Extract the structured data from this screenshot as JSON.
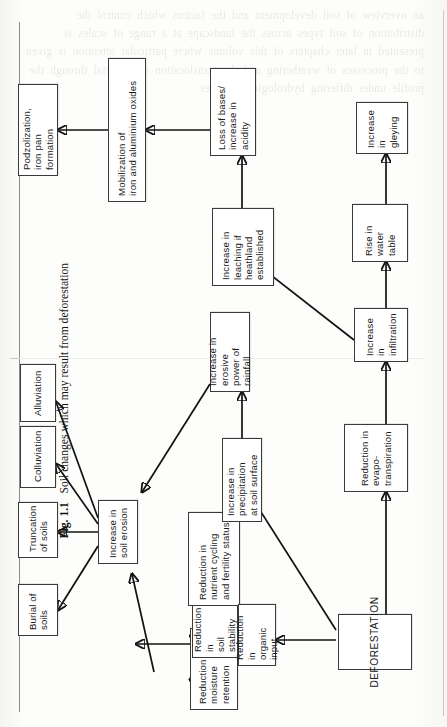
{
  "figure": {
    "caption_label": "Fig. 1.1",
    "caption_text": "Soil changes which may result from deforestation",
    "orientation": "rotated-90-ccw",
    "background_bleed_text": "an overview of soil development and the factors which control the distribution of soil types across the landscape at a range of scales is presented in later chapters of this volume where particular attention is given to the processes of weathering and the translocation of material through the profile under differing hydrological regimes",
    "colors": {
      "paper": "#fcfcfa",
      "ink": "#121212",
      "box_border": "#3a3a3a",
      "box_fill": "#ffffff",
      "rule": "#8d8d8d"
    }
  },
  "nodes": [
    {
      "id": "deforestation",
      "label": "DEFORESTATION"
    },
    {
      "id": "organic_input",
      "label": "Reduction in\norganic input"
    },
    {
      "id": "moisture",
      "label": "Reduction in\nmoisture retention"
    },
    {
      "id": "stability",
      "label": "Reduction in\nsoil stability"
    },
    {
      "id": "nutrient",
      "label": "Reduction in\nnutrient cycling\nand fertility status"
    },
    {
      "id": "precipitation",
      "label": "Increase in precipitation\nat soil surface"
    },
    {
      "id": "erosive",
      "label": "Increase in erosive\npower of rainfall"
    },
    {
      "id": "erosion",
      "label": "Increase in\nsoil erosion"
    },
    {
      "id": "burial",
      "label": "Burial of\nsoils"
    },
    {
      "id": "truncation",
      "label": "Truncation\nof soils"
    },
    {
      "id": "colluviation",
      "label": "Colluviation"
    },
    {
      "id": "alluviation",
      "label": "Alluviation"
    },
    {
      "id": "evapo",
      "label": "Reduction in\nevapo-transpiration"
    },
    {
      "id": "infiltration",
      "label": "Increase in\ninfiltration"
    },
    {
      "id": "watertable",
      "label": "Rise in\nwater table"
    },
    {
      "id": "gleying",
      "label": "Increase in\ngleying"
    },
    {
      "id": "leaching",
      "label": "Increase in\nleaching if\nheathland established"
    },
    {
      "id": "bases",
      "label": "Loss of bases/\nincrease in acidity"
    },
    {
      "id": "mobilization",
      "label": "Mobilization of\niron and aluminium oxides"
    },
    {
      "id": "podzolization",
      "label": "Podzolization,\niron pan formation"
    }
  ],
  "edges": [
    {
      "from": "deforestation",
      "to": "organic_input"
    },
    {
      "from": "deforestation",
      "to": "precipitation"
    },
    {
      "from": "deforestation",
      "to": "evapo"
    },
    {
      "from": "organic_input",
      "to": "moisture"
    },
    {
      "from": "organic_input",
      "to": "stability"
    },
    {
      "from": "organic_input",
      "to": "nutrient"
    },
    {
      "from": "organic_input",
      "to": "erosion"
    },
    {
      "from": "precipitation",
      "to": "erosive"
    },
    {
      "from": "erosive",
      "to": "erosion"
    },
    {
      "from": "moisture",
      "to": "erosion"
    },
    {
      "from": "erosion",
      "to": "burial"
    },
    {
      "from": "erosion",
      "to": "truncation"
    },
    {
      "from": "erosion",
      "to": "colluviation"
    },
    {
      "from": "erosion",
      "to": "alluviation"
    },
    {
      "from": "evapo",
      "to": "infiltration"
    },
    {
      "from": "infiltration",
      "to": "watertable"
    },
    {
      "from": "infiltration",
      "to": "leaching"
    },
    {
      "from": "watertable",
      "to": "gleying"
    },
    {
      "from": "leaching",
      "to": "bases"
    },
    {
      "from": "bases",
      "to": "mobilization"
    },
    {
      "from": "mobilization",
      "to": "podzolization"
    }
  ]
}
